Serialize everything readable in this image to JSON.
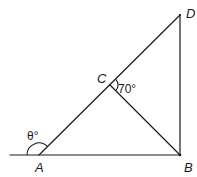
{
  "diagram": {
    "points": {
      "A": "A",
      "B": "B",
      "C": "C",
      "D": "D"
    },
    "angles": {
      "theta": "θ°",
      "angle_C": "70°"
    },
    "segments": [
      "AB (extended left)",
      "AD",
      "CB",
      "BD"
    ]
  }
}
